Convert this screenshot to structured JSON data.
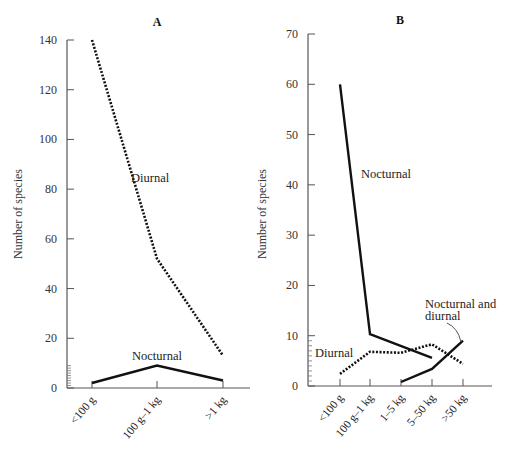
{
  "chart_data": [
    {
      "type": "line",
      "panel": "A",
      "title": "A",
      "xlabel": "",
      "ylabel": "Number of species",
      "ylim": [
        0,
        140
      ],
      "yticks": [
        0,
        20,
        40,
        60,
        80,
        100,
        120,
        140
      ],
      "categories": [
        "<100 g",
        "100 g–1 kg",
        ">1 kg"
      ],
      "series": [
        {
          "name": "Diurnal",
          "style": "dotted",
          "values": [
            140,
            52,
            13
          ]
        },
        {
          "name": "Nocturnal",
          "style": "solid",
          "values": [
            2,
            9,
            3
          ]
        }
      ],
      "annotations": [
        {
          "text": "Diurnal",
          "near": "Diurnal"
        },
        {
          "text": "Nocturnal",
          "near": "Nocturnal"
        }
      ],
      "grid": false,
      "legend": "none (inline labels)"
    },
    {
      "type": "line",
      "panel": "B",
      "title": "B",
      "xlabel": "",
      "ylabel": "Number of species",
      "ylim": [
        0,
        70
      ],
      "yticks": [
        0,
        10,
        20,
        30,
        40,
        50,
        60,
        70
      ],
      "categories": [
        "<100 g",
        "100 g–1 kg",
        "1–5 kg",
        "5–50 kg",
        ">50 kg"
      ],
      "series": [
        {
          "name": "Nocturnal",
          "style": "solid",
          "values": [
            60,
            10.3,
            null,
            5.6,
            null
          ]
        },
        {
          "name": "Diurnal",
          "style": "dotted",
          "values": [
            2.4,
            6.8,
            6.6,
            8.3,
            4.4
          ]
        },
        {
          "name": "Nocturnal and diurnal",
          "style": "solid",
          "values": [
            null,
            null,
            0.8,
            3.4,
            9
          ]
        }
      ],
      "annotations": [
        {
          "text": "Nocturnal",
          "near": "Nocturnal"
        },
        {
          "text": "Diurnal",
          "near": "Diurnal"
        },
        {
          "text": "Nocturnal and diurnal",
          "near": "Nocturnal and diurnal",
          "leader_line": true
        }
      ],
      "grid": false,
      "legend": "none (inline labels)"
    }
  ],
  "panels": {
    "a": {
      "title": "A",
      "ylabel": "Number of species",
      "yticks": [
        "0",
        "20",
        "40",
        "60",
        "80",
        "100",
        "120",
        "140"
      ],
      "xticks": [
        "<100 g",
        "100 g–1 kg",
        ">1 kg"
      ],
      "labels": {
        "diurnal": "Diurnal",
        "nocturnal": "Nocturnal"
      }
    },
    "b": {
      "title": "B",
      "ylabel": "Number of species",
      "yticks": [
        "0",
        "10",
        "20",
        "30",
        "40",
        "50",
        "60",
        "70"
      ],
      "xticks": [
        "<100 g",
        "100 g–1 kg",
        "1–5 kg",
        "5–50 kg",
        ">50 kg"
      ],
      "labels": {
        "nocturnal": "Nocturnal",
        "diurnal": "Diurnal",
        "both_line1": "Nocturnal and",
        "both_line2": "diurnal"
      }
    }
  }
}
